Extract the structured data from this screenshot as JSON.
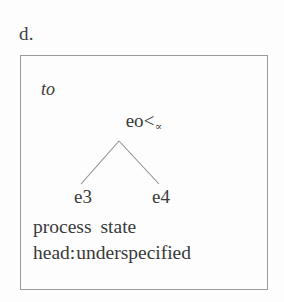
{
  "figure": {
    "example_label": "d.",
    "box": {
      "border_color": "#9a9a9a",
      "background": "#fdfdfd"
    },
    "time_index": "to",
    "tree": {
      "root": {
        "main": "eo",
        "relation": "<",
        "subscript": "∝"
      },
      "leaves": [
        {
          "label": "e3"
        },
        {
          "label": "e4"
        }
      ],
      "branch_color": "#8f8f8f"
    },
    "features": {
      "aspect_row": {
        "left": "process",
        "right": "state"
      },
      "head_row": {
        "key": "head:",
        "value": "underspecified"
      }
    }
  }
}
